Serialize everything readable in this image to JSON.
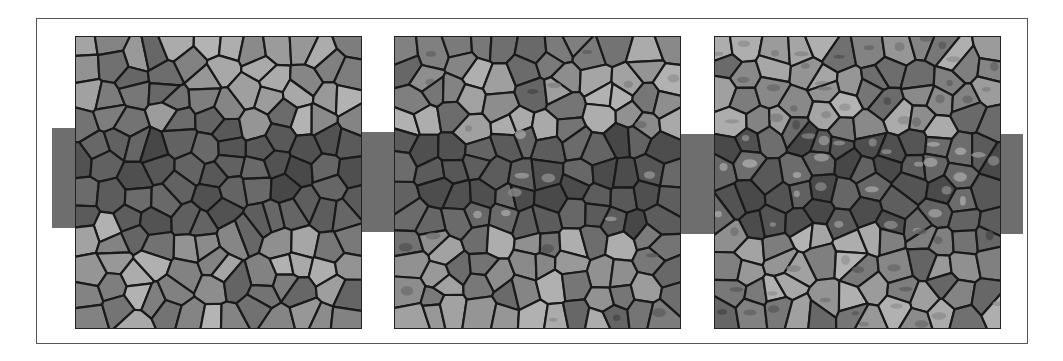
{
  "figure": {
    "band_color": "#6e6e6e",
    "edge_color": "#1a1a1a",
    "background": "#ffffff",
    "panels": [
      {
        "id": "left",
        "x": 75,
        "band": {
          "x": 52,
          "y": 128,
          "w": 309,
          "h": 100
        },
        "seed": 11,
        "texture": "flat"
      },
      {
        "id": "middle",
        "x": 394,
        "band": {
          "x": 361,
          "y": 132,
          "w": 319,
          "h": 100
        },
        "seed": 29,
        "texture": "flat-with-specks"
      },
      {
        "id": "right",
        "x": 714,
        "band": {
          "x": 680,
          "y": 134,
          "w": 343,
          "h": 100
        },
        "seed": 47,
        "texture": "highlighted-edges"
      }
    ]
  }
}
